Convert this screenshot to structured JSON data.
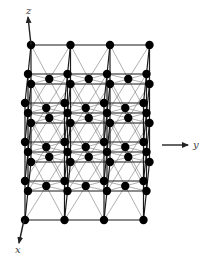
{
  "figure": {
    "colors": {
      "background": "#ffffff",
      "bond_front": "#1a1a1a",
      "bond_back": "#7a7a7a",
      "atom": "#000000",
      "axis": "#222222",
      "label": "#444444"
    },
    "lattice": {
      "cells_y": 3,
      "cells_x": 2,
      "cells_z": 3,
      "body_centered": true,
      "origin_px": [
        31,
        45
      ],
      "vec_y_px": [
        39.5,
        0
      ],
      "vec_x_px": [
        -3,
        29
      ],
      "vec_z_px": [
        0,
        39
      ],
      "atom_radius_px": 4.2
    },
    "axes": {
      "z": {
        "label": "z",
        "from": [
          31,
          45
        ],
        "to": [
          28,
          17
        ],
        "label_pos": [
          26,
          14
        ]
      },
      "y": {
        "label": "y",
        "from": [
          162,
          145
        ],
        "to": [
          188,
          145
        ],
        "label_pos": [
          193,
          148
        ]
      },
      "x": {
        "label": "x",
        "from": [
          24,
          220
        ],
        "to": [
          19,
          243
        ],
        "label_pos": [
          15,
          253
        ]
      }
    }
  }
}
